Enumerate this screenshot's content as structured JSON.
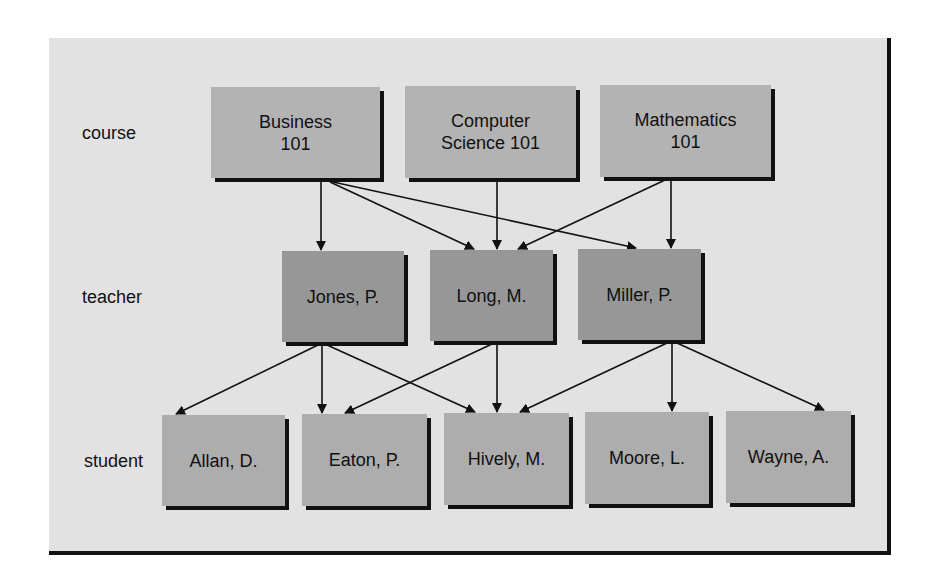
{
  "colors": {
    "frame_bg": "#e2e2e2",
    "course_box": "#b3b3b3",
    "teacher_box": "#979797",
    "student_box": "#adadad",
    "edge": "#111111"
  },
  "levels": [
    {
      "id": "course",
      "label": "course"
    },
    {
      "id": "teacher",
      "label": "teacher"
    },
    {
      "id": "student",
      "label": "student"
    }
  ],
  "nodes": {
    "courses": [
      {
        "id": "business101",
        "label": "Business\n101"
      },
      {
        "id": "cs101",
        "label": "Computer\nScience 101"
      },
      {
        "id": "math101",
        "label": "Mathematics\n101"
      }
    ],
    "teachers": [
      {
        "id": "jones",
        "label": "Jones, P."
      },
      {
        "id": "long",
        "label": "Long, M."
      },
      {
        "id": "miller",
        "label": "Miller, P."
      }
    ],
    "students": [
      {
        "id": "allan",
        "label": "Allan, D."
      },
      {
        "id": "eaton",
        "label": "Eaton, P."
      },
      {
        "id": "hively",
        "label": "Hively, M."
      },
      {
        "id": "moore",
        "label": "Moore, L."
      },
      {
        "id": "wayne",
        "label": "Wayne, A."
      }
    ]
  },
  "edges": [
    {
      "from": "business101",
      "to": "jones"
    },
    {
      "from": "business101",
      "to": "long"
    },
    {
      "from": "business101",
      "to": "miller"
    },
    {
      "from": "cs101",
      "to": "long"
    },
    {
      "from": "math101",
      "to": "long"
    },
    {
      "from": "math101",
      "to": "miller"
    },
    {
      "from": "jones",
      "to": "allan"
    },
    {
      "from": "jones",
      "to": "eaton"
    },
    {
      "from": "jones",
      "to": "hively"
    },
    {
      "from": "long",
      "to": "eaton"
    },
    {
      "from": "long",
      "to": "hively"
    },
    {
      "from": "miller",
      "to": "hively"
    },
    {
      "from": "miller",
      "to": "moore"
    },
    {
      "from": "miller",
      "to": "wayne"
    }
  ]
}
